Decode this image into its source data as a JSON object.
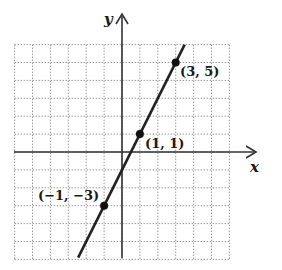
{
  "chart_data": {
    "type": "line",
    "title": "",
    "xlabel": "x",
    "ylabel": "y",
    "xlim": [
      -6,
      6
    ],
    "ylim": [
      -6,
      6
    ],
    "grid": true,
    "equation": "y = 2x - 1",
    "series": [
      {
        "name": "line",
        "x": [
          -2.45,
          3.5
        ],
        "y": [
          -5.9,
          6.0
        ]
      }
    ],
    "points": [
      {
        "x": 3,
        "y": 5,
        "label": "(3, 5)"
      },
      {
        "x": 1,
        "y": 1,
        "label": "(1, 1)"
      },
      {
        "x": -1,
        "y": -3,
        "label": "(−1, −3)"
      }
    ]
  },
  "labels": {
    "x_axis": "x",
    "y_axis": "y",
    "p1": "(3, 5)",
    "p2": "(1, 1)",
    "p3": "(−1, −3)"
  }
}
